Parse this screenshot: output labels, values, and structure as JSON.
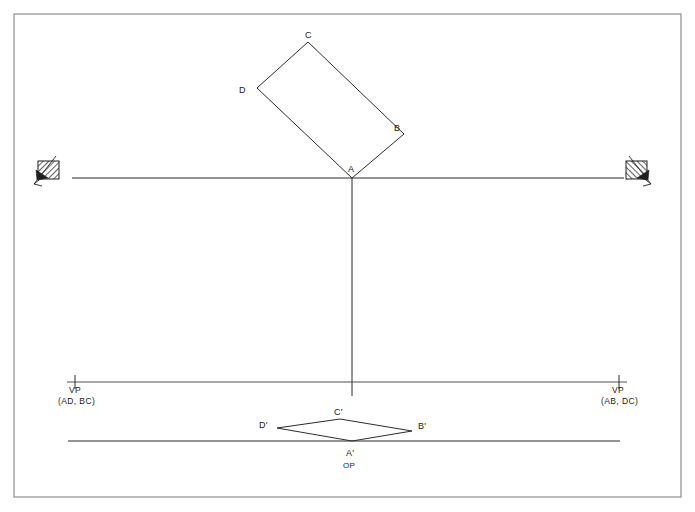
{
  "document": {
    "title": "Two-Point Perspective Construction",
    "background_color": "#ffffff",
    "line_color": "#2b2b2b",
    "border_color": "#8d8d8d"
  },
  "border": {
    "x": 14,
    "y": 14,
    "width": 667,
    "height": 483
  },
  "horizon_line": {
    "label": "horizon-line",
    "x1": 72,
    "y1": 178,
    "x2": 624,
    "y2": 178
  },
  "vertical_line": {
    "label": "vertical-measuring-line",
    "x1": 352,
    "y1": 178,
    "x2": 352,
    "y2": 396
  },
  "vp_line": {
    "label": "vanishing-point-line",
    "x1": 67,
    "y1": 382,
    "x2": 627,
    "y2": 382
  },
  "ground_line": {
    "label": "ground-line",
    "x1": 68,
    "y1": 441,
    "x2": 620,
    "y2": 441
  },
  "top_figure": {
    "name": "plan-rectangle",
    "vertices": [
      {
        "id": "A",
        "label": "A",
        "x": 352,
        "y": 178,
        "label_x": 348,
        "label_y": 172
      },
      {
        "id": "B",
        "label": "B",
        "x": 404,
        "y": 134,
        "label_x": 394,
        "label_y": 131
      },
      {
        "id": "C",
        "label": "C",
        "x": 308,
        "y": 42,
        "label_x": 305,
        "label_y": 38
      },
      {
        "id": "D",
        "label": "D",
        "x": 257,
        "y": 88,
        "label_x": 239,
        "label_y": 93
      }
    ]
  },
  "bottom_figure": {
    "name": "perspective-parallelogram",
    "vertices": [
      {
        "id": "Aprime",
        "label": "A'",
        "x": 352,
        "y": 441,
        "label_x": 346,
        "label_y": 456
      },
      {
        "id": "Bprime",
        "label": "B'",
        "x": 412,
        "y": 431,
        "label_x": 418,
        "label_y": 429
      },
      {
        "id": "Cprime",
        "label": "C'",
        "x": 340,
        "y": 419,
        "label_x": 334,
        "label_y": 415
      },
      {
        "id": "Dprime",
        "label": "D'",
        "x": 277,
        "y": 428,
        "label_x": 259,
        "label_y": 428
      }
    ],
    "origin_label": {
      "text": "OP",
      "x": 343,
      "y": 468
    }
  },
  "vanishing_points": {
    "left": {
      "name": "vanishing-point-left",
      "tick_x": 75,
      "tick_y": 382,
      "label_line1": "VP",
      "label_line2": "(AD, BC)",
      "label1_x": 69,
      "label1_y": 393,
      "label2_x": 58,
      "label2_y": 404
    },
    "right": {
      "name": "vanishing-point-right",
      "tick_x": 619,
      "tick_y": 382,
      "label_line1": "VP",
      "label_line2": "(AB, DC)",
      "label1_x": 612,
      "label1_y": 393,
      "label2_x": 601,
      "label2_y": 404
    }
  },
  "arrow_markers": {
    "left": {
      "name": "left-hatched-arrow-marker",
      "x": 36,
      "y": 160,
      "width": 22,
      "height": 20
    },
    "right": {
      "name": "right-hatched-arrow-marker",
      "x": 625,
      "y": 160,
      "width": 22,
      "height": 20
    }
  }
}
